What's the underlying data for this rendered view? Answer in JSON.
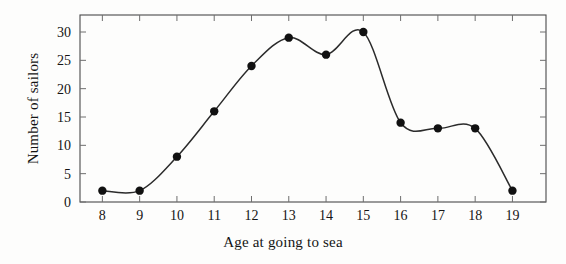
{
  "chart_data": {
    "type": "line",
    "title": "",
    "xlabel": "Age at going to sea",
    "ylabel": "Number of sailors",
    "x": [
      8,
      9,
      10,
      11,
      12,
      13,
      14,
      15,
      16,
      17,
      18,
      19
    ],
    "values": [
      2,
      2,
      8,
      16,
      24,
      29,
      26,
      30,
      14,
      13,
      13,
      2
    ],
    "categories": [
      "8",
      "9",
      "10",
      "11",
      "12",
      "13",
      "14",
      "15",
      "16",
      "17",
      "18",
      "19"
    ],
    "xtick_labels": [
      "8",
      "9",
      "10",
      "11",
      "12",
      "13",
      "14",
      "15",
      "16",
      "17",
      "18",
      "19"
    ],
    "ytick_labels": [
      "0",
      "5",
      "10",
      "15",
      "20",
      "25",
      "30"
    ],
    "yticks": [
      0,
      5,
      10,
      15,
      20,
      25,
      30
    ],
    "xlim": [
      7.4,
      19.9
    ],
    "ylim": [
      0,
      33
    ],
    "grid": false,
    "legend": null,
    "marker": "filled-circle",
    "interpolation": "smooth-spline",
    "line_color": "#2b2b2b",
    "marker_color": "#111111",
    "frame_color": "#4a4a4a",
    "background_color": "#fdfdfc"
  }
}
